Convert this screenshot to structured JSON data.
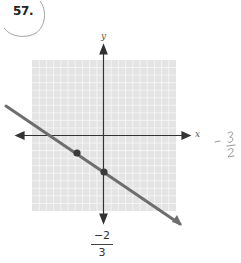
{
  "problem": {
    "number": "57."
  },
  "graph": {
    "x_axis_label": "x",
    "y_axis_label": "y",
    "grid": {
      "min": -10,
      "max": 10,
      "step": 1
    },
    "line": {
      "slope": "-2/3",
      "y_intercept": -5
    },
    "points": [
      {
        "label": "y-intercept",
        "x": 0,
        "y": -5
      },
      {
        "label": "second point",
        "x": -3,
        "y": -3
      }
    ],
    "colors": {
      "grid_bg": "#e4e4e4",
      "grid_line": "#f7f7f7",
      "axis": "#333333",
      "line": "#6e6e6e",
      "point": "#3a3a3a"
    }
  },
  "answer_fraction": {
    "numerator": "−2",
    "denominator": "3"
  },
  "handwritten_note": {
    "text": "− 3/2"
  }
}
